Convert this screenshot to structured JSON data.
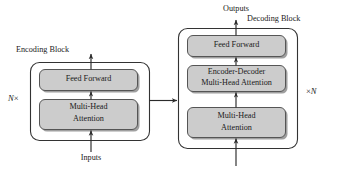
{
  "diagram": {
    "type": "block-diagram",
    "colors": {
      "box_fill": "#c9c9c9",
      "box_stroke": "#4d4d4d",
      "outer_stroke": "#333333",
      "arrow": "#2b2b2b",
      "background": "#ffffff",
      "text": "#1a1a1a"
    }
  },
  "encoder": {
    "label": "Encoding Block",
    "repeat": {
      "count": "N",
      "symbol": "×",
      "display": "N×"
    },
    "layers": [
      {
        "name": "feed-forward",
        "label": "Feed Forward",
        "lines": [
          "Feed Forward"
        ]
      },
      {
        "name": "multi-head-attention",
        "label": "Multi-Head Attention",
        "lines": [
          "Multi-Head",
          "Attention"
        ]
      }
    ],
    "input_label": "Inputs"
  },
  "decoder": {
    "label": "Decoding Block",
    "repeat": {
      "count": "N",
      "symbol": "×",
      "display": "×N"
    },
    "layers": [
      {
        "name": "feed-forward",
        "label": "Feed Forward",
        "lines": [
          "Feed Forward"
        ]
      },
      {
        "name": "encoder-decoder-multi-head-attention",
        "label": "Encoder-Decoder Multi-Head Attention",
        "lines": [
          "Encoder-Decoder",
          "Multi-Head Attention"
        ]
      },
      {
        "name": "multi-head-attention",
        "label": "Multi-Head Attention",
        "lines": [
          "Multi-Head",
          "Attention"
        ]
      }
    ],
    "output_label": "Outputs"
  },
  "connectors": [
    {
      "name": "encoder-input-arrow",
      "direction": "up"
    },
    {
      "name": "encoder-internal-arrow",
      "direction": "up"
    },
    {
      "name": "encoder-output-arrow",
      "direction": "up"
    },
    {
      "name": "encoder-to-decoder-arrow",
      "direction": "right"
    },
    {
      "name": "decoder-input-arrow",
      "direction": "up"
    },
    {
      "name": "decoder-internal-arrow-lower",
      "direction": "up"
    },
    {
      "name": "decoder-internal-arrow-upper",
      "direction": "up"
    },
    {
      "name": "decoder-output-arrow",
      "direction": "up"
    }
  ]
}
